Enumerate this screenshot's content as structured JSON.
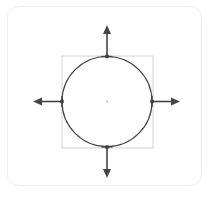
{
  "card": {
    "name": "shape-transform-card",
    "background_color": "#ffffff",
    "border_color": "#ececec",
    "corner_radius": 12,
    "x": 7,
    "y": 6,
    "width": 195,
    "height": 180
  },
  "diagram": {
    "title": "",
    "stroke_color": "#454545",
    "selection_box_color": "#c9c9c9",
    "handle_color": "#3d3d3d",
    "center_dot_color": "#cbbdbd",
    "background_color": "#ffffff"
  },
  "shape": {
    "type": "circle",
    "center_x": 107,
    "center_y": 101.5,
    "radius": 45,
    "stroke_width": 1.2,
    "fill": "none",
    "label": "circle-shape"
  },
  "selection_box": {
    "x": 62,
    "y": 56,
    "width": 91,
    "height": 92,
    "stroke_width": 0.8,
    "label": "selection-bounding-box"
  },
  "handles": [
    {
      "name": "handle-top",
      "x": 107,
      "y": 56.5,
      "size": 3.4
    },
    {
      "name": "handle-right",
      "x": 152,
      "y": 101.5,
      "size": 3.4
    },
    {
      "name": "handle-bottom",
      "x": 107,
      "y": 147,
      "size": 3.4
    },
    {
      "name": "handle-left",
      "x": 62,
      "y": 101.5,
      "size": 3.4
    }
  ],
  "center_point": {
    "name": "shape-center-point",
    "x": 107,
    "y": 101.5,
    "radius": 1.1
  },
  "arrows": [
    {
      "name": "arrow-up",
      "direction": "up",
      "tail_x": 107,
      "tail_y": 56,
      "tip_x": 107,
      "tip_y": 25,
      "head_width": 8,
      "head_length": 9,
      "stroke_width": 1.6
    },
    {
      "name": "arrow-right",
      "direction": "right",
      "tail_x": 152,
      "tail_y": 101.5,
      "tip_x": 180,
      "tip_y": 101.5,
      "head_width": 8,
      "head_length": 9,
      "stroke_width": 1.6
    },
    {
      "name": "arrow-down",
      "direction": "down",
      "tail_x": 107,
      "tail_y": 147,
      "tip_x": 107,
      "tip_y": 178,
      "head_width": 8,
      "head_length": 9,
      "stroke_width": 1.6
    },
    {
      "name": "arrow-left",
      "direction": "left",
      "tail_x": 62,
      "tail_y": 101.5,
      "tip_x": 33,
      "tip_y": 101.5,
      "head_width": 8,
      "head_length": 9,
      "stroke_width": 1.6
    }
  ],
  "arrow_caps": [
    {
      "name": "arrow-cap-top",
      "cx": 107,
      "cy": 56.5,
      "half": 5.5,
      "orientation": "horizontal"
    },
    {
      "name": "arrow-cap-bottom",
      "cx": 107,
      "cy": 147,
      "half": 5.5,
      "orientation": "horizontal"
    },
    {
      "name": "arrow-cap-left",
      "cx": 62,
      "cy": 101.5,
      "half": 5.5,
      "orientation": "vertical"
    },
    {
      "name": "arrow-cap-right",
      "cx": 152,
      "cy": 101.5,
      "half": 5.5,
      "orientation": "vertical"
    }
  ]
}
